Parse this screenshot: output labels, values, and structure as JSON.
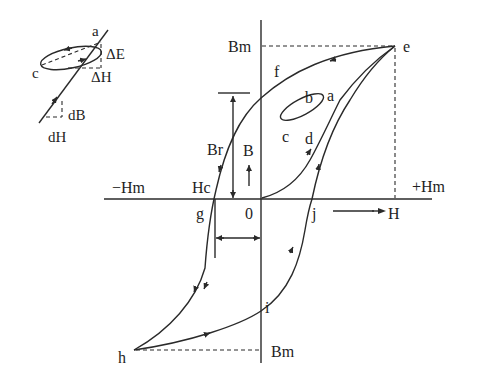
{
  "diagram": {
    "axes": {
      "neg_h_label": "−Hm",
      "pos_h_label": "+Hm",
      "h_label": "H",
      "origin_label": "0",
      "b_label": "B",
      "bm_top_label": "Bm",
      "bm_bottom_label": "Bm"
    },
    "points": {
      "a": "a",
      "b": "b",
      "c": "c",
      "d": "d",
      "e": "e",
      "f": "f",
      "g": "g",
      "h": "h",
      "i": "i",
      "j": "j"
    },
    "dimensions": {
      "remanence": "Br",
      "coercivity": "Hc"
    },
    "inset": {
      "a": "a",
      "c": "c",
      "delta_e": "ΔE",
      "delta_h": "ΔH",
      "db": "dB",
      "dh": "dH"
    }
  }
}
